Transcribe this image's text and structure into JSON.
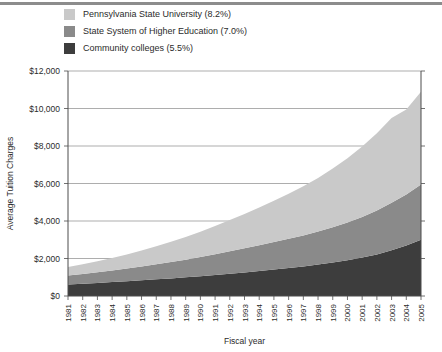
{
  "legend": {
    "position": "top-left",
    "items": [
      {
        "label": "Pennsylvania State University (8.2%)",
        "color": "#c9c9c9",
        "series": "Pennsylvania State University"
      },
      {
        "label": "State System of Higher Education (7.0%)",
        "color": "#8a8a8a",
        "series": "State System of Higher Education"
      },
      {
        "label": "Community colleges (5.5%)",
        "color": "#3d3d3d",
        "series": "Community colleges"
      }
    ]
  },
  "axes": {
    "ylabel": "Average Tuition Charges",
    "xlabel": "Fiscal year",
    "yticks": [
      "$0",
      "$2,000",
      "$4,000",
      "$6,000",
      "$8,000",
      "$10,000",
      "$12,000"
    ],
    "ytick_values": [
      0,
      2000,
      4000,
      6000,
      8000,
      10000,
      12000
    ],
    "ylim": [
      0,
      12000
    ],
    "grid": true
  },
  "chart_data": {
    "type": "area",
    "stacked": true,
    "title": "",
    "xlabel": "Fiscal year",
    "ylabel": "Average Tuition Charges",
    "ylim": [
      0,
      12000
    ],
    "grid": true,
    "legend_position": "top-left",
    "categories": [
      "1981",
      "1982",
      "1983",
      "1984",
      "1985",
      "1986",
      "1987",
      "1988",
      "1989",
      "1990",
      "1991",
      "1992",
      "1993",
      "1994",
      "1995",
      "1996",
      "1997",
      "1998",
      "1999",
      "2000",
      "2001",
      "2002",
      "2003",
      "2004",
      "2005"
    ],
    "series": [
      {
        "name": "Community colleges",
        "growth_rate": "5.5%",
        "color": "#3d3d3d",
        "stack_order": 1,
        "values": [
          620,
          660,
          700,
          745,
          790,
          840,
          890,
          940,
          1000,
          1060,
          1120,
          1190,
          1260,
          1330,
          1410,
          1490,
          1580,
          1680,
          1790,
          1910,
          2050,
          2220,
          2440,
          2700,
          3000
        ]
      },
      {
        "name": "State System of Higher Education",
        "growth_rate": "7.0%",
        "color": "#8a8a8a",
        "stack_order": 2,
        "values": [
          480,
          520,
          570,
          620,
          680,
          740,
          800,
          870,
          940,
          1020,
          1110,
          1200,
          1290,
          1380,
          1470,
          1560,
          1650,
          1760,
          1880,
          2010,
          2170,
          2340,
          2530,
          2720,
          2950
        ]
      },
      {
        "name": "Pennsylvania State University",
        "growth_rate": "8.2%",
        "color": "#c9c9c9",
        "stack_order": 3,
        "values": [
          450,
          510,
          580,
          660,
          750,
          850,
          960,
          1080,
          1210,
          1350,
          1500,
          1660,
          1830,
          2010,
          2200,
          2400,
          2620,
          2860,
          3130,
          3430,
          3760,
          4120,
          4520,
          4530,
          4950
        ]
      }
    ],
    "totals": [
      1550,
      1690,
      1850,
      2025,
      2220,
      2430,
      2650,
      2890,
      3150,
      3430,
      3730,
      4050,
      4380,
      4720,
      5080,
      5450,
      5850,
      6300,
      6800,
      7350,
      7980,
      8680,
      9490,
      9950,
      10900
    ]
  }
}
